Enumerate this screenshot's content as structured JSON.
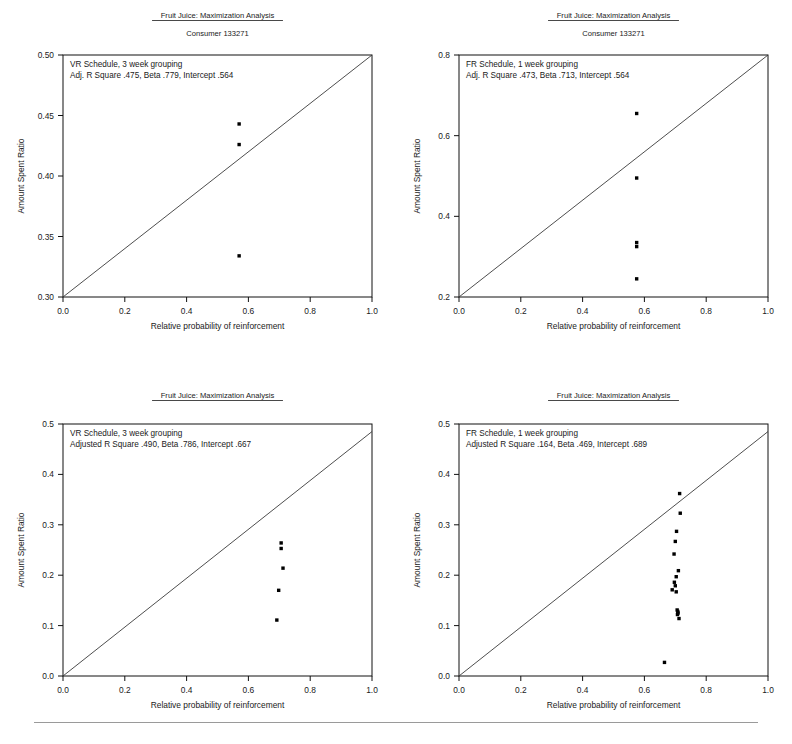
{
  "page": {
    "background": "#ffffff",
    "width": 792,
    "height": 744,
    "point_color": "#000000",
    "line_color": "#3a3a3a",
    "axis_color": "#111111"
  },
  "chart_data": [
    {
      "id": "top-left",
      "type": "scatter",
      "title": "Fruit Juice: Maximization Analysis",
      "subtitle": "Consumer 133271",
      "annotation_line1": "VR Schedule, 3 week grouping",
      "annotation_line2": "Adj. R Square .475, Beta .779, Intercept .564",
      "xlabel": "Relative probability of reinforcement",
      "ylabel": "Amount Spent Ratio",
      "xlim": [
        0.0,
        1.0
      ],
      "ylim": [
        0.3,
        0.5
      ],
      "xticks": [
        0.0,
        0.2,
        0.4,
        0.6,
        0.8,
        1.0
      ],
      "xticklabels": [
        "0.0",
        "0.2",
        "0.4",
        "0.6",
        "0.8",
        "1.0"
      ],
      "yticks": [
        0.3,
        0.35,
        0.4,
        0.45,
        0.5
      ],
      "yticklabels": [
        "0.30",
        "0.35",
        "0.40",
        "0.45",
        "0.50"
      ],
      "grid": false,
      "legend": "none",
      "reference_line": {
        "x": [
          0.0,
          1.0
        ],
        "y": [
          0.3,
          0.5
        ]
      },
      "x": [
        0.57,
        0.57,
        0.57
      ],
      "y": [
        0.443,
        0.426,
        0.334
      ]
    },
    {
      "id": "top-right",
      "type": "scatter",
      "title": "Fruit Juice: Maximization Analysis",
      "subtitle": "Consumer 133271",
      "annotation_line1": "FR Schedule, 1 week grouping",
      "annotation_line2": "Adj. R Square .473, Beta .713, Intercept .564",
      "xlabel": "Relative probability of reinforcement",
      "ylabel": "Amount Spent Ratio",
      "xlim": [
        0.0,
        1.0
      ],
      "ylim": [
        0.2,
        0.8
      ],
      "xticks": [
        0.0,
        0.2,
        0.4,
        0.6,
        0.8,
        1.0
      ],
      "xticklabels": [
        "0.0",
        "0.2",
        "0.4",
        "0.6",
        "0.8",
        "1.0"
      ],
      "yticks": [
        0.2,
        0.4,
        0.6,
        0.8
      ],
      "yticklabels": [
        "0.2",
        "0.4",
        "0.6",
        "0.8"
      ],
      "grid": false,
      "legend": "none",
      "reference_line": {
        "x": [
          0.0,
          1.0
        ],
        "y": [
          0.2,
          0.8
        ]
      },
      "x": [
        0.575,
        0.575,
        0.575,
        0.575,
        0.575
      ],
      "y": [
        0.655,
        0.495,
        0.335,
        0.325,
        0.245
      ]
    },
    {
      "id": "bottom-left",
      "type": "scatter",
      "title": "Fruit Juice: Maximization Analysis",
      "subtitle": "",
      "annotation_line1": "VR Schedule, 3 week grouping",
      "annotation_line2": "Adjusted R Square .490, Beta .786, Intercept .667",
      "xlabel": "Relative probability of reinforcement",
      "ylabel": "Amount Spent Ratio",
      "xlim": [
        0.0,
        1.0
      ],
      "ylim": [
        0.0,
        0.5
      ],
      "xticks": [
        0.0,
        0.2,
        0.4,
        0.6,
        0.8,
        1.0
      ],
      "xticklabels": [
        "0.0",
        "0.2",
        "0.4",
        "0.6",
        "0.8",
        "1.0"
      ],
      "yticks": [
        0.0,
        0.1,
        0.2,
        0.3,
        0.4,
        0.5
      ],
      "yticklabels": [
        "0.0",
        "0.1",
        "0.2",
        "0.3",
        "0.4",
        "0.5"
      ],
      "grid": false,
      "legend": "none",
      "reference_line": {
        "x": [
          0.0,
          1.0
        ],
        "y": [
          0.0,
          0.485
        ]
      },
      "x": [
        0.706,
        0.706,
        0.712,
        0.698,
        0.692
      ],
      "y": [
        0.264,
        0.253,
        0.214,
        0.17,
        0.111
      ]
    },
    {
      "id": "bottom-right",
      "type": "scatter",
      "title": "Fruit Juice: Maximization Analysis",
      "subtitle": "",
      "annotation_line1": "FR Schedule, 1 week grouping",
      "annotation_line2": "Adjusted R Square .164, Beta .469, Intercept .689",
      "xlabel": "Relative probability of reinforcement",
      "ylabel": "Amount Spent Ratio",
      "xlim": [
        0.0,
        1.0
      ],
      "ylim": [
        0.0,
        0.5
      ],
      "xticks": [
        0.0,
        0.2,
        0.4,
        0.6,
        0.8,
        1.0
      ],
      "xticklabels": [
        "0.0",
        "0.2",
        "0.4",
        "0.6",
        "0.8",
        "1.0"
      ],
      "yticks": [
        0.0,
        0.1,
        0.2,
        0.3,
        0.4,
        0.5
      ],
      "yticklabels": [
        "0.0",
        "0.1",
        "0.2",
        "0.3",
        "0.4",
        "0.5"
      ],
      "grid": false,
      "legend": "none",
      "reference_line": {
        "x": [
          0.0,
          1.0
        ],
        "y": [
          0.0,
          0.485
        ]
      },
      "x": [
        0.714,
        0.716,
        0.704,
        0.7,
        0.696,
        0.703,
        0.71,
        0.697,
        0.7,
        0.69,
        0.703,
        0.706,
        0.708,
        0.709,
        0.707,
        0.712,
        0.665
      ],
      "y": [
        0.362,
        0.323,
        0.287,
        0.267,
        0.242,
        0.197,
        0.209,
        0.186,
        0.179,
        0.171,
        0.167,
        0.131,
        0.128,
        0.125,
        0.122,
        0.114,
        0.027
      ]
    }
  ]
}
